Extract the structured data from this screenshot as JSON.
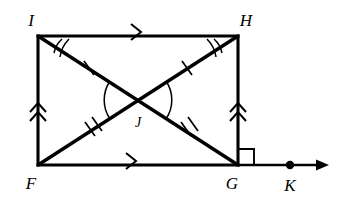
{
  "figure": {
    "type": "geometry-diagram",
    "stroke_color": "#000000",
    "background_color": "#ffffff",
    "vertices": [
      {
        "id": "I",
        "label": "I",
        "x": 38,
        "y": 36,
        "label_x": 31,
        "label_y": 26
      },
      {
        "id": "H",
        "label": "H",
        "x": 238,
        "y": 36,
        "label_x": 246,
        "label_y": 26
      },
      {
        "id": "F",
        "label": "F",
        "x": 38,
        "y": 165,
        "label_x": 31,
        "label_y": 189
      },
      {
        "id": "G",
        "label": "G",
        "x": 238,
        "y": 165,
        "label_x": 232,
        "label_y": 189
      },
      {
        "id": "J",
        "label": "J",
        "x": 138,
        "y": 100,
        "label_x": 134,
        "label_y": 127
      },
      {
        "id": "K",
        "label": "K",
        "x": 290,
        "y": 165,
        "label_x": 284,
        "label_y": 189
      }
    ],
    "sides": [
      {
        "name": "top-side-IH",
        "from": "I",
        "to": "H",
        "parallel_marks": 1
      },
      {
        "name": "bottom-side-FG",
        "from": "F",
        "to": "G",
        "parallel_marks": 1
      },
      {
        "name": "left-side-IF",
        "from": "I",
        "to": "F",
        "parallel_marks": 2
      },
      {
        "name": "right-side-HG",
        "from": "H",
        "to": "G",
        "parallel_marks": 2
      }
    ],
    "diagonals": [
      {
        "name": "diagonal-IG",
        "from": "I",
        "to": "G"
      },
      {
        "name": "diagonal-HF",
        "from": "H",
        "to": "F"
      }
    ],
    "congruence_ticks": [
      {
        "segment": "IJ",
        "ticks": 1
      },
      {
        "segment": "JH",
        "ticks": 1
      },
      {
        "segment": "FJ",
        "ticks": 2
      },
      {
        "segment": "JG",
        "ticks": 2
      }
    ],
    "angle_marks": [
      {
        "at": "I",
        "arcs": 2,
        "between": "IH and IG"
      },
      {
        "at": "H",
        "arcs": 2,
        "between": "IH and HF"
      },
      {
        "at": "J",
        "arcs": 1,
        "between": "left vertical angle FJI"
      },
      {
        "at": "J",
        "arcs": 1,
        "between": "right vertical angle HJG"
      }
    ],
    "right_angle": {
      "at": "G",
      "between": "GH and ray GK"
    },
    "ray": {
      "name": "ray-GK",
      "from": "G",
      "through": "K",
      "arrow_end_x": 326,
      "y": 165
    }
  }
}
